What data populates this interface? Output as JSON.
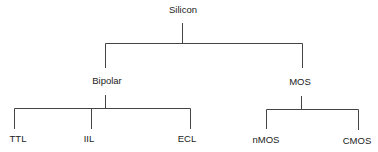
{
  "diagram": {
    "type": "tree",
    "line_color": "#444444",
    "root": {
      "label": "Silicon",
      "children": [
        {
          "label": "Bipolar",
          "children": [
            {
              "label": "TTL"
            },
            {
              "label": "IIL"
            },
            {
              "label": "ECL"
            }
          ]
        },
        {
          "label": "MOS",
          "children": [
            {
              "label": "nMOS"
            },
            {
              "label": "CMOS"
            }
          ]
        }
      ]
    }
  }
}
